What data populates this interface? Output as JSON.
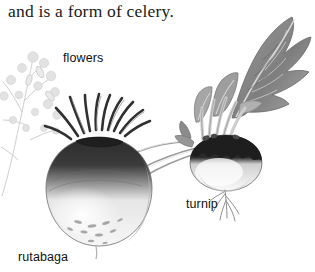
{
  "figure": {
    "caption": "and is a form of celery.",
    "background_color": "#ffffff",
    "labels": {
      "flowers": "flowers",
      "turnip": "turnip",
      "rutabaga": "rutabaga"
    },
    "illustration": {
      "style": "grayscale halftone botanical engraving",
      "subjects": [
        {
          "name": "flower-sprig",
          "tone": "#d8d8d8",
          "position": "left"
        },
        {
          "name": "rutabaga-root",
          "tone": "#2b2b2b crown / #f2f2f2 body",
          "position": "center-left"
        },
        {
          "name": "turnip-root",
          "tone": "#242424 crown / #fafafa body",
          "position": "center-right"
        },
        {
          "name": "turnip-greens",
          "tone": "#8c8c8c",
          "position": "top-right"
        }
      ]
    },
    "colors": {
      "ink": "#111111",
      "caption_ink": "#1b1b1b",
      "dark_crown": "#2b2b2b",
      "mid_gray": "#8c8c8c",
      "pale_gray": "#dedede"
    }
  }
}
